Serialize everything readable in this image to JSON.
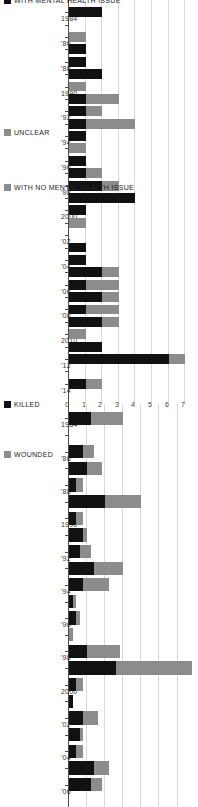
{
  "figure": {
    "orientation": "rotated-90",
    "background": "#ffffff",
    "colors": {
      "killed": "#111111",
      "wounded": "#8c8c8c",
      "with_mental_health_issue": "#111111",
      "unclear": "#8c8c8c",
      "with_no_mental_health_issue": "#8c8c8c",
      "grid": "#d9d9d9",
      "axis": "#4d4d4d"
    }
  },
  "chart_data": [
    {
      "id": "casualties",
      "type": "bar",
      "subtype": "stacked-horizontal",
      "title": "",
      "xlabel": "",
      "ylabel": "",
      "legend_position": "bottom-left",
      "grid": true,
      "xlim": [
        0,
        34
      ],
      "categories": [
        "1984",
        "'85",
        "'86",
        "'87",
        "'88",
        "'89",
        "1990",
        "'91",
        "'92",
        "'93",
        "'94",
        "'95",
        "'96",
        "'97",
        "'98",
        "1999",
        "2000",
        "'01",
        "'02",
        "'03",
        "'04",
        "'05",
        "'06"
      ],
      "tick_labels": [
        "1984",
        "",
        "'86",
        "",
        "'88",
        "",
        "1990",
        "",
        "'92",
        "",
        "'94",
        "",
        "'96",
        "",
        "'98",
        "",
        "2000",
        "",
        "'02",
        "",
        "'04",
        "",
        "'06"
      ],
      "series": [
        {
          "name": "KILLED",
          "values": [
            6,
            0,
            4,
            5,
            2,
            10,
            2,
            4,
            3,
            7,
            4,
            1,
            2,
            0,
            5,
            13,
            2,
            1,
            4,
            3,
            2,
            7,
            6
          ]
        },
        {
          "name": "WOUNDED",
          "values": [
            9,
            0,
            3,
            4,
            2,
            10,
            2,
            1,
            3,
            8,
            7,
            1,
            1,
            1,
            9,
            21,
            2,
            0,
            4,
            1,
            2,
            4,
            3
          ]
        }
      ]
    },
    {
      "id": "mental-health",
      "type": "bar",
      "subtype": "stacked-horizontal",
      "title": "",
      "xlabel": "",
      "ylabel": "",
      "legend_position": "bottom-left",
      "grid": true,
      "xlim": [
        0,
        7.4
      ],
      "xticks": [
        0,
        1,
        2,
        3,
        4,
        5,
        6,
        7
      ],
      "xtick_labels": [
        "0",
        "1",
        "2",
        "3",
        "4",
        "5",
        "6",
        "7"
      ],
      "categories": [
        "1984",
        "'85",
        "'86",
        "'87",
        "'88",
        "'89",
        "1990",
        "'91",
        "'92",
        "'93",
        "'94",
        "'95",
        "'96",
        "'97",
        "'98",
        "1999",
        "2000",
        "'01",
        "'02",
        "'03",
        "'04",
        "'05",
        "'06",
        "'07",
        "'08",
        "'09",
        "2010",
        "'11",
        "'12",
        "'13",
        "'14"
      ],
      "tick_labels": [
        "1984",
        "",
        "'86",
        "",
        "'88",
        "",
        "1990",
        "",
        "'92",
        "",
        "'94",
        "",
        "'96",
        "",
        "'98",
        "",
        "2000",
        "",
        "'02",
        "",
        "'04",
        "",
        "'06",
        "",
        "'08",
        "",
        "2010",
        "",
        "'12",
        "",
        "'14"
      ],
      "series": [
        {
          "name": "WITH MENTAL HEALTH ISSUE",
          "values": [
            2,
            0,
            0,
            1,
            1,
            2,
            0,
            1,
            1,
            1,
            1,
            0,
            1,
            1,
            2,
            4,
            1,
            0,
            0,
            1,
            1,
            2,
            1,
            2,
            1,
            2,
            0,
            2,
            6,
            0,
            1
          ]
        },
        {
          "name": "UNCLEAR",
          "values": [
            0,
            0,
            1,
            0,
            0,
            0,
            1,
            2,
            1,
            3,
            0,
            1,
            0,
            1,
            1,
            0,
            0,
            1,
            0,
            0,
            0,
            1,
            2,
            1,
            2,
            1,
            1,
            0,
            1,
            0,
            1
          ]
        },
        {
          "name": "WITH NO MENTAL HEALTH ISSUE",
          "values": [
            0,
            0,
            0,
            0,
            0,
            0,
            0,
            0,
            0,
            0,
            0,
            0,
            0,
            0,
            0,
            0,
            0,
            0,
            0,
            0,
            0,
            0,
            0,
            0,
            0,
            0,
            0,
            0,
            0,
            0,
            0
          ]
        }
      ]
    }
  ],
  "casualties_legend": [
    {
      "label": "KILLED",
      "color": "#111111"
    },
    {
      "label": "WOUNDED",
      "color": "#8c8c8c"
    }
  ],
  "mental_legend": [
    {
      "label": "WITH MENTAL HEALTH ISSUE",
      "color": "#111111"
    },
    {
      "label": "UNCLEAR",
      "color": "#8c8c8c"
    },
    {
      "label": "WITH NO MENTAL HEALTH ISSUE",
      "color": "#8c8c8c"
    }
  ]
}
